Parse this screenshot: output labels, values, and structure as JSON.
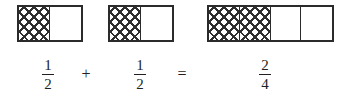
{
  "figure": {
    "colors": {
      "background": "#ffffff",
      "line": "#2b2b2b",
      "hatch": "#2f2f2f",
      "text": "#231f20"
    }
  },
  "models": [
    {
      "id": "model-1",
      "total_parts": 2,
      "shaded_parts": 1,
      "cells": [
        "shaded",
        "empty"
      ]
    },
    {
      "id": "model-2",
      "total_parts": 2,
      "shaded_parts": 1,
      "cells": [
        "shaded",
        "empty"
      ]
    },
    {
      "id": "model-3",
      "total_parts": 4,
      "shaded_parts": 2,
      "cells": [
        "shaded",
        "shaded",
        "empty",
        "empty"
      ]
    }
  ],
  "equation": {
    "text": "1/2 + 1/2 = 2/4",
    "terms": [
      {
        "numerator": "1",
        "denominator": "2"
      },
      {
        "numerator": "1",
        "denominator": "2"
      },
      {
        "numerator": "2",
        "denominator": "4"
      }
    ],
    "operators": {
      "plus": "+",
      "equals": "="
    }
  }
}
